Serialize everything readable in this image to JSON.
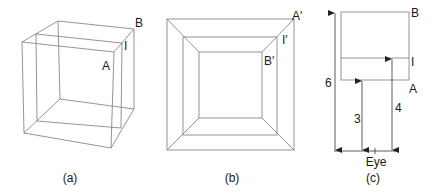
{
  "figure": {
    "panels": [
      {
        "id": "a",
        "caption": "(a)",
        "description": "Wireframe perspective cube with an intermediate image plane",
        "labels": {
          "A": "A",
          "B": "B",
          "I": "I"
        }
      },
      {
        "id": "b",
        "caption": "(b)",
        "description": "Front view of the cube as nested squares",
        "labels": {
          "A": "A′",
          "B": "B′",
          "I": "I′"
        }
      },
      {
        "id": "c",
        "caption": "(c)",
        "description": "Side view with distances from the eye",
        "labels": {
          "A": "A",
          "B": "B",
          "I": "I",
          "eye": "Eye"
        },
        "dimensions": [
          {
            "label": "6",
            "to": "B"
          },
          {
            "label": "3",
            "to": "A"
          },
          {
            "label": "4",
            "to": "I"
          }
        ]
      }
    ],
    "colors": {
      "line": "#7a7a7a",
      "text": "#1a1a1a"
    }
  }
}
